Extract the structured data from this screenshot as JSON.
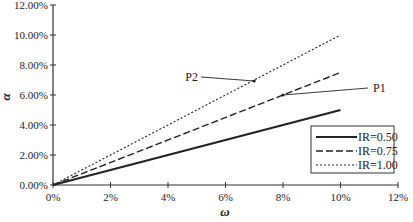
{
  "chart_data": {
    "type": "line",
    "title": "",
    "xlabel": "ω",
    "ylabel": "α",
    "x": [
      0,
      10
    ],
    "xlim": [
      0,
      12
    ],
    "ylim": [
      0,
      12
    ],
    "x_ticks": [
      "0%",
      "2%",
      "4%",
      "6%",
      "8%",
      "10%",
      "12%"
    ],
    "y_ticks": [
      "0.00%",
      "2.00%",
      "4.00%",
      "6.00%",
      "8.00%",
      "10.00%",
      "12.00%"
    ],
    "grid": false,
    "legend_position": "lower right",
    "series": [
      {
        "name": "IR=0.50",
        "style": "solid",
        "x": [
          0,
          10
        ],
        "values": [
          0,
          5.0
        ]
      },
      {
        "name": "IR=0.75",
        "style": "dashed",
        "x": [
          0,
          10
        ],
        "values": [
          0,
          7.5
        ]
      },
      {
        "name": "IR=1.00",
        "style": "dotted",
        "x": [
          0,
          10
        ],
        "values": [
          0,
          10.0
        ]
      }
    ],
    "annotations": [
      {
        "label": "P2",
        "points_to": "IR=1.00",
        "at_x": 7.0
      },
      {
        "label": "P1",
        "points_to": "IR=0.75",
        "at_x": 8.0
      }
    ]
  }
}
